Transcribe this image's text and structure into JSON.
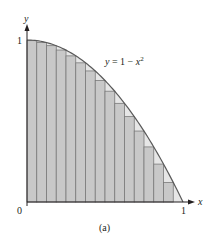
{
  "figure": {
    "caption": "(a)",
    "curve_label": "y = 1 − x",
    "curve_label_exp": "2",
    "y_axis_label": "y",
    "x_axis_label": "x",
    "y_tick_1": "1",
    "x_tick_0": "0",
    "x_tick_1": "1"
  },
  "colors": {
    "bar_fill": "#c8c8c8",
    "bar_stroke": "#7a7a7a",
    "gap_fill": "#e6e6e6",
    "curve": "#5a5a5a",
    "axis": "#231f20"
  },
  "chart_data": {
    "type": "bar",
    "title": "",
    "xlabel": "x",
    "ylabel": "y",
    "function": "y = 1 - x^2",
    "method": "lower Riemann sum (right endpoints), n = 16",
    "xlim": [
      0,
      1
    ],
    "ylim": [
      0,
      1
    ],
    "grid": false,
    "legend": null,
    "x_ticks": [
      "0",
      "1"
    ],
    "y_ticks": [
      "1"
    ],
    "annotations": [
      "y = 1 − x²",
      "(a)"
    ],
    "categories": [
      "0–0.0625",
      "0.0625–0.125",
      "0.125–0.1875",
      "0.1875–0.25",
      "0.25–0.3125",
      "0.3125–0.375",
      "0.375–0.4375",
      "0.4375–0.5",
      "0.5–0.5625",
      "0.5625–0.625",
      "0.625–0.6875",
      "0.6875–0.75",
      "0.75–0.8125",
      "0.8125–0.875",
      "0.875–0.9375",
      "0.9375–1"
    ],
    "values": [
      0.996,
      0.984,
      0.965,
      0.938,
      0.902,
      0.859,
      0.809,
      0.75,
      0.684,
      0.609,
      0.527,
      0.438,
      0.34,
      0.234,
      0.121,
      0.0
    ]
  }
}
